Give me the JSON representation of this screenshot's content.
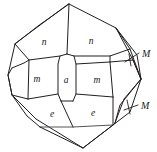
{
  "figure": {
    "kind": "crystal-form-drawing",
    "background_color": "#ffffff",
    "line_color": "#231f20",
    "width": 157,
    "height": 152
  },
  "labels": {
    "face_n_left": "n",
    "face_n_right": "n",
    "face_m_left": "m",
    "face_a_center": "a",
    "face_m_right": "m",
    "face_e_left": "e",
    "face_e_right": "e",
    "index_M_upper": "M",
    "index_M_lower": "M"
  },
  "label_positions": {
    "face_n_left": {
      "x": 44,
      "y": 43
    },
    "face_n_right": {
      "x": 91,
      "y": 42
    },
    "face_m_left": {
      "x": 37,
      "y": 80
    },
    "face_a_center": {
      "x": 66,
      "y": 81
    },
    "face_m_right": {
      "x": 97,
      "y": 81
    },
    "face_e_left": {
      "x": 52,
      "y": 115
    },
    "face_e_right": {
      "x": 93,
      "y": 114
    },
    "index_M_upper": {
      "x": 142,
      "y": 55
    },
    "index_M_lower": {
      "x": 141,
      "y": 107
    }
  },
  "geometry": {
    "outline": "69,4 116,28 137,55 141,79 130,112 83,148 36,119 12,95 8,75 15,44",
    "edges": [
      {
        "name": "top-apex-to-n-divider",
        "path": "M 69,4 L 67,54"
      },
      {
        "name": "upper-left-rim",
        "path": "M 15,44 L 38,26 L 69,4"
      },
      {
        "name": "n-left-lower-edge",
        "path": "M 15,44 L 29,60 L 60,56"
      },
      {
        "name": "n-left-to-a-top",
        "path": "M 60,56 L 67,54"
      },
      {
        "name": "n-right-lower-edge",
        "path": "M 74,56 L 110,56 L 130,49"
      },
      {
        "name": "a-top-to-n-right",
        "path": "M 67,54 L 74,56"
      },
      {
        "name": "right-upper-taper-outer",
        "path": "M 116,28 L 137,55 L 141,79"
      },
      {
        "name": "right-upper-taper-inner",
        "path": "M 116,28 L 130,49 L 141,79"
      },
      {
        "name": "right-upper-taper-mid",
        "path": "M 116,28 L 133,60 L 141,79"
      },
      {
        "name": "m-left-upper-edge",
        "path": "M 29,60 L 24,63 L 12,68"
      },
      {
        "name": "left-vertex-edges",
        "path": "M 12,68 L 8,75 L 12,95"
      },
      {
        "name": "m-left-lower-edge",
        "path": "M 12,95 L 28,99"
      },
      {
        "name": "m-left-right-edge",
        "path": "M 29,60 L 28,99"
      },
      {
        "name": "a-left-edge",
        "path": "M 60,56 L 58,64 L 58,94 L 61,101"
      },
      {
        "name": "a-right-edge",
        "path": "M 74,56 L 76,64 L 76,94 L 73,101"
      },
      {
        "name": "m-center-band-top",
        "path": "M 28,99 L 58,94"
      },
      {
        "name": "a-bottom-join",
        "path": "M 61,101 L 73,101"
      },
      {
        "name": "m-right-bottom-edge",
        "path": "M 76,94 L 113,97"
      },
      {
        "name": "m-right-upper-edge",
        "path": "M 76,64 L 110,62"
      },
      {
        "name": "m-right-outer-edge",
        "path": "M 110,56 L 110,62 L 113,97"
      },
      {
        "name": "right-mid-to-vertex",
        "path": "M 110,62 L 133,60 L 141,79"
      },
      {
        "name": "right-lower-taper-outer",
        "path": "M 141,79 L 130,112 L 115,123"
      },
      {
        "name": "right-lower-taper-inner",
        "path": "M 141,79 L 124,99 L 115,123"
      },
      {
        "name": "right-lower-taper-mid",
        "path": "M 141,79 L 120,105 L 115,123"
      },
      {
        "name": "e-left-edges",
        "path": "M 12,95 L 27,116 L 40,127"
      },
      {
        "name": "e-divider",
        "path": "M 61,101 L 73,127"
      },
      {
        "name": "e-left-bottom",
        "path": "M 40,127 L 73,127"
      },
      {
        "name": "e-right-bottom",
        "path": "M 73,127 L 113,125"
      },
      {
        "name": "e-right-outer",
        "path": "M 113,97 L 113,125 L 115,123"
      },
      {
        "name": "bottom-apex-left",
        "path": "M 36,119 L 83,148"
      },
      {
        "name": "bottom-apex-right",
        "path": "M 83,148 L 115,123"
      },
      {
        "name": "bottom-left-rim",
        "path": "M 12,95 L 36,119"
      },
      {
        "name": "bottom-apex-inner-left",
        "path": "M 40,127 L 83,148"
      },
      {
        "name": "bottom-apex-inner-right",
        "path": "M 83,148 L 113,125"
      }
    ],
    "leaders": [
      {
        "name": "M-upper-leader",
        "path": "M 139,53 L 125,62 M 129,54 L 131,66"
      },
      {
        "name": "M-lower-leader",
        "path": "M 138,105 L 124,110 M 127,101 L 130,114"
      }
    ]
  }
}
